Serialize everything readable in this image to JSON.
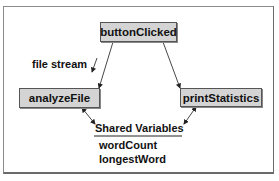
{
  "diagram": {
    "nodes": [
      {
        "id": "buttonClicked",
        "label": "buttonClicked"
      },
      {
        "id": "analyzeFile",
        "label": "analyzeFile"
      },
      {
        "id": "printStatistics",
        "label": "printStatistics"
      }
    ],
    "edge_label": "file stream",
    "shared": {
      "title": "Shared Variables",
      "variables": [
        "wordCount",
        "longestWord"
      ]
    },
    "edges": [
      {
        "from": "buttonClicked",
        "to": "analyzeFile",
        "label": "file stream"
      },
      {
        "from": "buttonClicked",
        "to": "printStatistics"
      },
      {
        "from": "analyzeFile",
        "to": "Shared Variables",
        "bidirectional": true
      },
      {
        "from": "printStatistics",
        "to": "Shared Variables",
        "bidirectional": true
      }
    ]
  }
}
